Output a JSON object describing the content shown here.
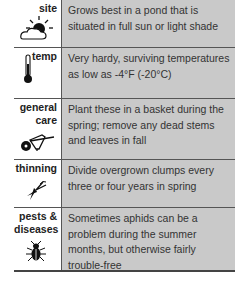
{
  "care_table": {
    "rows": [
      {
        "label": "site",
        "icon": "sun-cloud-icon",
        "text": "Grows best in a pond that is situated in full sun or light shade"
      },
      {
        "label": "temp",
        "icon": "thermometer-icon",
        "text": "Very hardy, surviving temperatures as low as -4°F (-20°C)"
      },
      {
        "label": "general care",
        "icon": "wheelbarrow-icon",
        "text": "Plant these in a basket during the spring; remove any dead stems and leaves in fall"
      },
      {
        "label": "thinning",
        "icon": "pruning-shears-icon",
        "text": "Divide overgrown clumps every three or four years in spring"
      },
      {
        "label": "pests & diseases",
        "icon": "beetle-icon",
        "text": "Sometimes aphids can be a problem during the summer months, but otherwise fairly trouble-free"
      }
    ]
  },
  "colors": {
    "text_bg": "#c9c9c9",
    "divider": "#555555"
  }
}
